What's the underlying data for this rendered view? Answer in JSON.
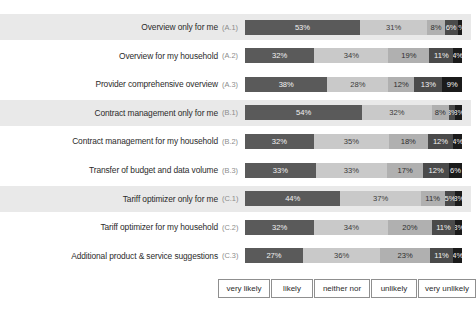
{
  "chart_data": {
    "type": "bar",
    "orientation": "horizontal",
    "stacked": true,
    "percent": true,
    "title": "",
    "xlabel": "",
    "ylabel": "",
    "xlim": [
      0,
      100
    ],
    "grid": false,
    "legend_position": "bottom",
    "categories": [
      "Overview only for me",
      "Overview for my household",
      "Provider comprehensive overview",
      "Contract management only for me",
      "Contract management for my household",
      "Transfer of budget and data volume",
      "Tariff optimizer only for me",
      "Tariff optimizer for my household",
      "Additional product & service suggestions"
    ],
    "category_codes": [
      "(A.1)",
      "(A.2)",
      "(A.3)",
      "(B.1)",
      "(B.2)",
      "(B.3)",
      "(C.1)",
      "(C.2)",
      "(C.3)"
    ],
    "series": [
      {
        "name": "very likely",
        "color": "#5a5a5a",
        "values": [
          53,
          32,
          38,
          54,
          32,
          33,
          44,
          32,
          27
        ]
      },
      {
        "name": "likely",
        "color": "#c9c9c9",
        "values": [
          31,
          34,
          28,
          32,
          35,
          33,
          37,
          34,
          36
        ]
      },
      {
        "name": "neither nor",
        "color": "#b0b0b0",
        "values": [
          8,
          19,
          12,
          8,
          18,
          17,
          11,
          20,
          23
        ]
      },
      {
        "name": "unlikely",
        "color": "#4a4a4a",
        "values": [
          6,
          11,
          13,
          3,
          12,
          12,
          5,
          11,
          11
        ]
      },
      {
        "name": "very unlikely",
        "color": "#1b1b1b",
        "values": [
          2,
          4,
          9,
          3,
          4,
          6,
          3,
          3,
          4
        ]
      }
    ],
    "legend": [
      "very likely",
      "likely",
      "neither nor",
      "unlikely",
      "very unlikely"
    ],
    "rows": [
      {
        "label": "Overview only for me",
        "code": "(A.1)",
        "banded": true,
        "segments": [
          {
            "label": "53%",
            "value": 53
          },
          {
            "label": "31%",
            "value": 31
          },
          {
            "label": "8%",
            "value": 8
          },
          {
            "label": "6%",
            "value": 6
          },
          {
            "label": "2%",
            "value": 2
          }
        ]
      },
      {
        "label": "Overview for my household",
        "code": "(A.2)",
        "banded": false,
        "segments": [
          {
            "label": "32%",
            "value": 32
          },
          {
            "label": "34%",
            "value": 34
          },
          {
            "label": "19%",
            "value": 19
          },
          {
            "label": "11%",
            "value": 11
          },
          {
            "label": "4%",
            "value": 4
          }
        ]
      },
      {
        "label": "Provider comprehensive overview",
        "code": "(A.3)",
        "banded": false,
        "segments": [
          {
            "label": "38%",
            "value": 38
          },
          {
            "label": "28%",
            "value": 28
          },
          {
            "label": "12%",
            "value": 12
          },
          {
            "label": "13%",
            "value": 13
          },
          {
            "label": "9%",
            "value": 9
          }
        ]
      },
      {
        "label": "Contract management only for me",
        "code": "(B.1)",
        "banded": true,
        "segments": [
          {
            "label": "54%",
            "value": 54
          },
          {
            "label": "32%",
            "value": 32
          },
          {
            "label": "8%",
            "value": 8
          },
          {
            "label": "3%",
            "value": 3
          },
          {
            "label": "3%",
            "value": 3
          }
        ]
      },
      {
        "label": "Contract management for my household",
        "code": "(B.2)",
        "banded": false,
        "segments": [
          {
            "label": "32%",
            "value": 32
          },
          {
            "label": "35%",
            "value": 35
          },
          {
            "label": "18%",
            "value": 18
          },
          {
            "label": "12%",
            "value": 12
          },
          {
            "label": "4%",
            "value": 4
          }
        ]
      },
      {
        "label": "Transfer of budget and data volume",
        "code": "(B.3)",
        "banded": false,
        "segments": [
          {
            "label": "33%",
            "value": 33
          },
          {
            "label": "33%",
            "value": 33
          },
          {
            "label": "17%",
            "value": 17
          },
          {
            "label": "12%",
            "value": 12
          },
          {
            "label": "6%",
            "value": 6
          }
        ]
      },
      {
        "label": "Tariff optimizer only for me",
        "code": "(C.1)",
        "banded": true,
        "segments": [
          {
            "label": "44%",
            "value": 44
          },
          {
            "label": "37%",
            "value": 37
          },
          {
            "label": "11%",
            "value": 11
          },
          {
            "label": "5%",
            "value": 5
          },
          {
            "label": "3%",
            "value": 3
          }
        ]
      },
      {
        "label": "Tariff optimizer for my household",
        "code": "(C.2)",
        "banded": false,
        "segments": [
          {
            "label": "32%",
            "value": 32
          },
          {
            "label": "34%",
            "value": 34
          },
          {
            "label": "20%",
            "value": 20
          },
          {
            "label": "11%",
            "value": 11
          },
          {
            "label": "3%",
            "value": 3
          }
        ]
      },
      {
        "label": "Additional product & service suggestions",
        "code": "(C.3)",
        "banded": false,
        "segments": [
          {
            "label": "27%",
            "value": 27
          },
          {
            "label": "36%",
            "value": 36
          },
          {
            "label": "23%",
            "value": 23
          },
          {
            "label": "11%",
            "value": 11
          },
          {
            "label": "4%",
            "value": 4
          }
        ]
      }
    ]
  }
}
